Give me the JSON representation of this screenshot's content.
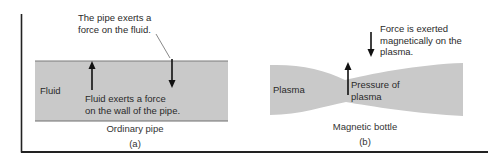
{
  "figure": {
    "panel_a": {
      "callout_top": [
        "The pipe exerts a",
        "force on the fluid."
      ],
      "medium_label": "Fluid",
      "force_label": [
        "Fluid exerts a force",
        "on the wall of the pipe."
      ],
      "caption": "Ordinary pipe",
      "panel_letter": "(a)"
    },
    "panel_b": {
      "callout_top": [
        "Force is exerted",
        "magnetically on the",
        "plasma."
      ],
      "medium_label": "Plasma",
      "force_label": [
        "Pressure of",
        "plasma"
      ],
      "caption": "Magnetic bottle",
      "panel_letter": "(b)"
    },
    "colors": {
      "fill": "#c9c9c9",
      "edge": "#7a7a7a",
      "arrow": "#111111",
      "frame": "#222222"
    }
  }
}
